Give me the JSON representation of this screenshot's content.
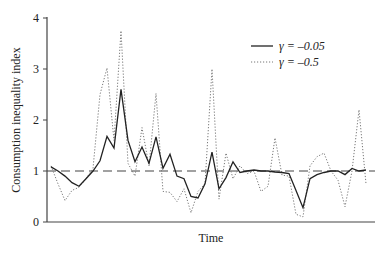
{
  "chart_data": {
    "type": "line",
    "title": "",
    "xlabel": "Time",
    "ylabel": "Consumption inequality index",
    "ylim": [
      0,
      4
    ],
    "yticks": [
      "0",
      "1",
      "2",
      "3",
      "4"
    ],
    "grid": false,
    "legend_position": "upper right",
    "reference_line": {
      "y": 1,
      "style": "dashed"
    },
    "x": [
      1,
      2,
      3,
      4,
      5,
      6,
      7,
      8,
      9,
      10,
      11,
      12,
      13,
      14,
      15,
      16,
      17,
      18,
      19,
      20,
      21,
      22,
      23,
      24,
      25,
      26,
      27,
      28,
      29,
      30,
      31,
      32,
      33,
      34,
      35,
      36,
      37,
      38,
      39,
      40,
      41,
      42,
      43,
      44,
      45,
      46
    ],
    "series": [
      {
        "name": "γ = –0.05",
        "style": "solid",
        "values": [
          1.08,
          1.0,
          0.9,
          0.77,
          0.7,
          0.85,
          1.0,
          1.2,
          1.68,
          1.45,
          2.6,
          1.6,
          1.18,
          1.47,
          1.15,
          1.67,
          1.05,
          1.33,
          0.9,
          0.85,
          0.5,
          0.47,
          0.75,
          1.37,
          0.65,
          0.87,
          1.18,
          0.97,
          1.0,
          1.02,
          1.0,
          1.0,
          0.98,
          0.97,
          0.95,
          0.62,
          0.28,
          0.85,
          0.93,
          0.97,
          1.0,
          1.0,
          0.93,
          1.05,
          1.0,
          1.02
        ]
      },
      {
        "name": "γ = –0.5",
        "style": "dotted",
        "values": [
          1.1,
          0.75,
          0.42,
          0.62,
          0.68,
          0.85,
          1.05,
          2.5,
          3.02,
          1.6,
          3.75,
          1.15,
          0.9,
          1.85,
          1.1,
          2.52,
          0.6,
          0.58,
          0.4,
          0.65,
          0.18,
          0.6,
          0.75,
          3.0,
          0.45,
          1.35,
          0.85,
          1.1,
          0.95,
          1.0,
          0.6,
          0.7,
          1.65,
          0.92,
          0.9,
          0.15,
          0.1,
          1.1,
          1.28,
          1.35,
          1.0,
          0.82,
          0.3,
          1.0,
          2.2,
          0.75
        ]
      }
    ]
  },
  "legend": {
    "items": [
      {
        "label": "γ = –0.05",
        "style": "solid"
      },
      {
        "label": "γ = –0.5",
        "style": "dotted"
      }
    ]
  }
}
